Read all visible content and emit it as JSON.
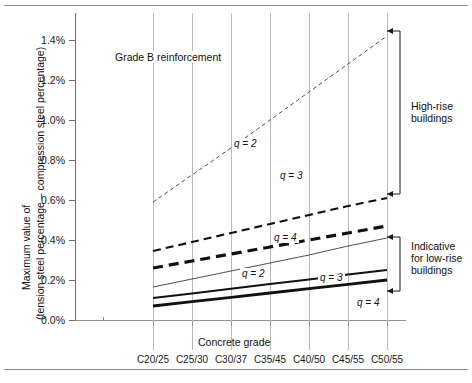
{
  "figure": {
    "note": "Grade B reinforcement",
    "axis": {
      "ylabel_line1": "Maximum value of",
      "ylabel_line2": "(tension steel percentage – compression steel percentage)",
      "xlabel": "Concrete grade",
      "yticks": [
        "0.0%",
        "0.2%",
        "0.4%",
        "0.6%",
        "0.8%",
        "1.0%",
        "1.2%",
        "1.4%"
      ],
      "xticks": [
        "C20/25",
        "C25/30",
        "C30/37",
        "C35/45",
        "C40/50",
        "C45/55",
        "C50/55"
      ]
    },
    "brackets": [
      {
        "name": "high-rise",
        "label_line1": "High-rise",
        "label_line2": "buildings"
      },
      {
        "name": "low-rise",
        "label_line1": "Indicative",
        "label_line2": "for low-rise",
        "label_line3": "buildings"
      }
    ],
    "series_labels": {
      "dashed_q2": "q = 2",
      "dashed_q3": "q = 3",
      "dashed_q4": "q = 4",
      "solid_q2": "q = 2",
      "solid_q3": "q = 3",
      "solid_q4": "q = 4"
    },
    "colors": {
      "ink": "#111111",
      "grid": "#b9b9b9",
      "axis": "#6f6f6f",
      "rule": "#8e8e8e",
      "background": "#ffffff"
    }
  },
  "chart_data": {
    "type": "line",
    "title": "Grade B reinforcement",
    "xlabel": "Concrete grade",
    "ylabel": "Maximum value of (tension steel percentage – compression steel percentage)",
    "categories": [
      "C20/25",
      "C25/30",
      "C30/37",
      "C35/45",
      "C40/50",
      "C45/55",
      "C50/55"
    ],
    "ylim": [
      0.0,
      1.5
    ],
    "yticks": [
      0.0,
      0.2,
      0.4,
      0.6,
      0.8,
      1.0,
      1.2,
      1.4
    ],
    "ytick_format": "percent",
    "grid": "vertical-only",
    "legend": "inline-annotations",
    "series": [
      {
        "name": "q = 2 (high-rise)",
        "style": "dashed-thin",
        "group": "high-rise",
        "values": [
          0.59,
          0.725,
          0.86,
          1.0,
          1.14,
          1.28,
          1.42
        ]
      },
      {
        "name": "q = 3 (high-rise)",
        "style": "dashed-medium",
        "group": "high-rise",
        "values": [
          0.345,
          0.39,
          0.435,
          0.48,
          0.525,
          0.57,
          0.61
        ]
      },
      {
        "name": "q = 4 (high-rise)",
        "style": "dashed-thick",
        "group": "high-rise",
        "values": [
          0.26,
          0.295,
          0.33,
          0.365,
          0.4,
          0.435,
          0.47
        ]
      },
      {
        "name": "q = 2 (low-rise)",
        "style": "solid-thin",
        "group": "low-rise",
        "values": [
          0.165,
          0.205,
          0.245,
          0.285,
          0.325,
          0.37,
          0.41
        ]
      },
      {
        "name": "q = 3 (low-rise)",
        "style": "solid-medium",
        "group": "low-rise",
        "values": [
          0.11,
          0.133,
          0.156,
          0.18,
          0.203,
          0.227,
          0.25
        ]
      },
      {
        "name": "q = 4 (low-rise)",
        "style": "solid-thick",
        "group": "low-rise",
        "values": [
          0.07,
          0.092,
          0.113,
          0.135,
          0.157,
          0.178,
          0.2
        ]
      }
    ],
    "annotations": [
      {
        "text": "q = 2",
        "series": "q = 2 (high-rise)"
      },
      {
        "text": "q = 3",
        "series": "q = 3 (high-rise)"
      },
      {
        "text": "q = 4",
        "series": "q = 4 (high-rise)"
      },
      {
        "text": "q = 2",
        "series": "q = 2 (low-rise)"
      },
      {
        "text": "q = 3",
        "series": "q = 3 (low-rise)"
      },
      {
        "text": "q = 4",
        "series": "q = 4 (low-rise)"
      },
      {
        "text": "High-rise buildings",
        "type": "bracket"
      },
      {
        "text": "Indicative for low-rise buildings",
        "type": "bracket"
      }
    ]
  }
}
